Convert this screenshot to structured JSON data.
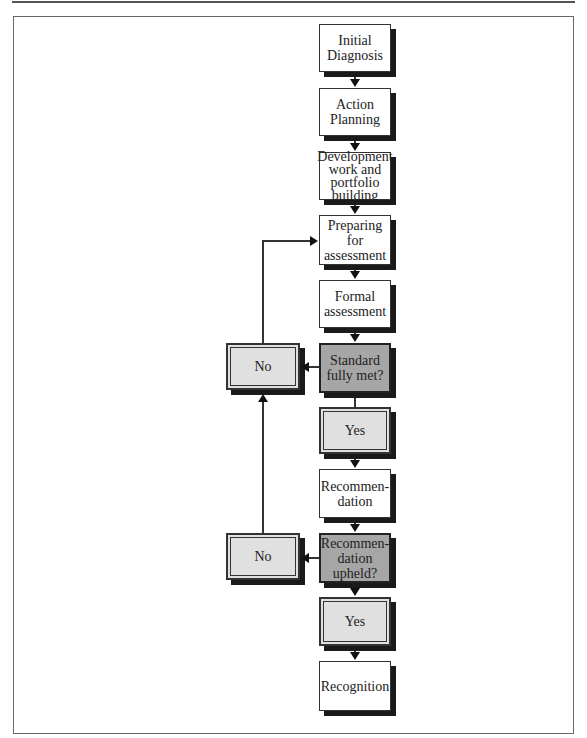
{
  "diagram": {
    "type": "flowchart",
    "nodes": {
      "initial_diagnosis": "Initial\nDiagnosis",
      "action_planning": "Action\nPlanning",
      "development": "Development\nwork and\nportfolio\nbuilding",
      "preparing": "Preparing\nfor\nassessment",
      "formal_assessment": "Formal\nassessment",
      "standard_met": "Standard\nfully met?",
      "yes_1": "Yes",
      "no_1": "No",
      "recommendation": "Recommen-\ndation",
      "recommendation_upheld": "Recommen-\ndation\nupheld?",
      "yes_2": "Yes",
      "no_2": "No",
      "recognition": "Recognition"
    },
    "edges": [
      {
        "from": "Initial Diagnosis",
        "to": "Action Planning"
      },
      {
        "from": "Action Planning",
        "to": "Development work and portfolio building"
      },
      {
        "from": "Development work and portfolio building",
        "to": "Preparing for assessment"
      },
      {
        "from": "Preparing for assessment",
        "to": "Formal assessment"
      },
      {
        "from": "Formal assessment",
        "to": "Standard fully met?"
      },
      {
        "from": "Standard fully met?",
        "to": "Yes"
      },
      {
        "from": "Standard fully met?",
        "to": "No"
      },
      {
        "from": "No",
        "to": "Preparing for assessment"
      },
      {
        "from": "Yes",
        "to": "Recommendation"
      },
      {
        "from": "Recommendation",
        "to": "Recommendation upheld?"
      },
      {
        "from": "Recommendation upheld?",
        "to": "Yes"
      },
      {
        "from": "Recommendation upheld?",
        "to": "No"
      },
      {
        "from": "No",
        "to": "No (Standard fully met?)"
      },
      {
        "from": "Yes",
        "to": "Recognition"
      }
    ]
  },
  "colors": {
    "process_fill": "#ffffff",
    "decision_fill": "#a6a6a6",
    "outcome_fill": "#e0e0e0",
    "shadow": "#1a1a1a",
    "line": "#333333"
  }
}
